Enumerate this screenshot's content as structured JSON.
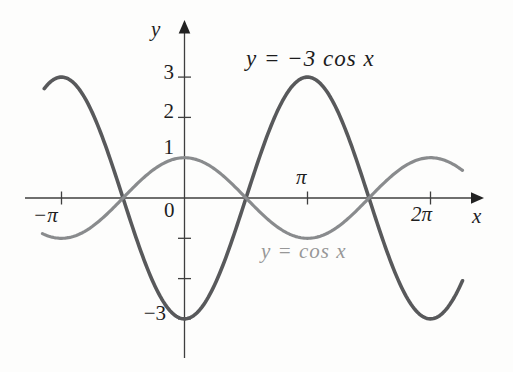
{
  "figure": {
    "background": "#fdfdfc",
    "axis_color": "#3f3f3f",
    "labels": {
      "origin": "0"
    }
  },
  "chart_data": {
    "type": "line",
    "title": "",
    "xlabel": "x",
    "ylabel": "y",
    "grid": false,
    "x_range_pi": [
      -1.3,
      2.45
    ],
    "y_range": [
      -4,
      4
    ],
    "x_ticks": [
      {
        "value_pi": -1,
        "label": "−π"
      },
      {
        "value_pi": 1,
        "label": "π"
      },
      {
        "value_pi": 2,
        "label": "2π"
      }
    ],
    "y_ticks": [
      {
        "value": 3,
        "label": "3"
      },
      {
        "value": 2,
        "label": "2"
      },
      {
        "value": 1,
        "label": "1"
      },
      {
        "value": -1,
        "label": ""
      },
      {
        "value": -2,
        "label": ""
      },
      {
        "value": -3,
        "label": "−3"
      }
    ],
    "series": [
      {
        "name": "y = −3 cos x",
        "function": "cos",
        "amplitude": -3,
        "period_pi": 2,
        "domain_pi": [
          -1.14,
          2.26
        ],
        "color": "#58595b",
        "stroke_width": 3.6,
        "key_points_pi": [
          [
            -1,
            3
          ],
          [
            -0.5,
            0
          ],
          [
            0,
            -3
          ],
          [
            0.5,
            0
          ],
          [
            1,
            3
          ],
          [
            1.5,
            0
          ],
          [
            2,
            -3
          ]
        ]
      },
      {
        "name": "y = cos x",
        "function": "cos",
        "amplitude": 1,
        "period_pi": 2,
        "domain_pi": [
          -1.155,
          2.26
        ],
        "color": "#898b8d",
        "stroke_width": 3.2,
        "key_points_pi": [
          [
            -1,
            -1
          ],
          [
            -0.5,
            0
          ],
          [
            0,
            1
          ],
          [
            0.5,
            0
          ],
          [
            1,
            -1
          ],
          [
            1.5,
            0
          ],
          [
            2,
            1
          ]
        ]
      }
    ],
    "axes": {
      "origin_px": [
        184.5,
        198
      ],
      "px_per_pi": 123,
      "px_per_unit": 40.3,
      "x_axis_px": {
        "from": 25,
        "to": 471,
        "arrow_tip": 484
      },
      "y_axis_px": {
        "from": 358,
        "to": 33,
        "arrow_tip": 20
      },
      "tick_half_len": 6.5
    }
  }
}
